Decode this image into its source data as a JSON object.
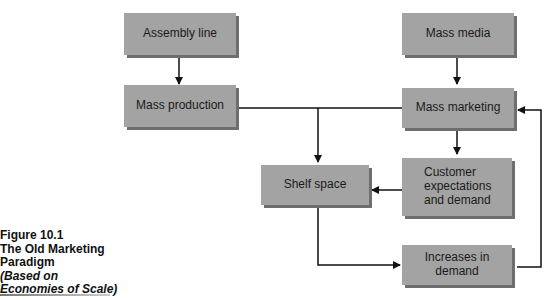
{
  "figure": {
    "number": "Figure 10.1",
    "title": "The Old Marketing Paradigm",
    "subtitle_line1": "(Based on",
    "subtitle_line2": "Economies of Scale)"
  },
  "nodes": {
    "assembly_line": "Assembly line",
    "mass_production": "Mass production",
    "mass_media": "Mass media",
    "mass_marketing": "Mass marketing",
    "shelf_space": "Shelf space",
    "customer_expectations": "Customer expectations and demand",
    "increases_in_demand": "Increases in demand"
  },
  "edges": [
    {
      "from": "Assembly line",
      "to": "Mass production"
    },
    {
      "from": "Mass media",
      "to": "Mass marketing"
    },
    {
      "from": "Mass production",
      "to": "Mass marketing"
    },
    {
      "from": "Mass production",
      "to": "Shelf space"
    },
    {
      "from": "Mass marketing",
      "to": "Customer expectations and demand"
    },
    {
      "from": "Customer expectations and demand",
      "to": "Shelf space"
    },
    {
      "from": "Shelf space",
      "to": "Increases in demand"
    },
    {
      "from": "Increases in demand",
      "to": "Mass marketing"
    }
  ],
  "colors": {
    "box_fill": "#a3a3a3",
    "box_shadow": "#6e6e6e",
    "line": "#111111"
  }
}
